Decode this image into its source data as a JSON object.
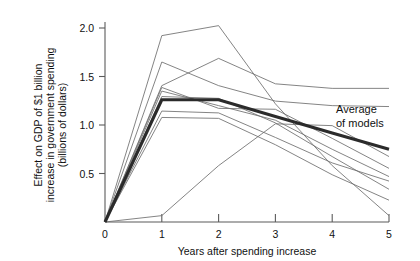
{
  "chart_data": {
    "type": "line",
    "title": "",
    "subtitle": "",
    "xlabel": "Years after spending increase",
    "ylabel": "Effect on GDP of $1 billion increase in government spending (billions of dollars)",
    "ylabel_line1": "Effect on GDP of $1 billion",
    "ylabel_line2": "increase in government spending",
    "ylabel_line3": "(billions of dollars)",
    "x": [
      0,
      1,
      2,
      3,
      4,
      5
    ],
    "xlim": [
      0,
      5
    ],
    "ylim": [
      0,
      2.2
    ],
    "xticks": [
      0,
      1,
      2,
      3,
      4,
      5
    ],
    "xtick_labels": [
      "0",
      "1",
      "2",
      "3",
      "4",
      "5"
    ],
    "yticks": [
      0,
      0.5,
      1.0,
      1.5,
      2.0
    ],
    "ytick_labels": [
      "0",
      "0.5",
      "1.0",
      "1.5",
      "2.0"
    ],
    "grid": false,
    "legend_position": "none",
    "annotations": [
      {
        "name": "average-of-models",
        "line1": "Average",
        "line2": "of models",
        "x": 4.05,
        "y": 1.13
      }
    ],
    "series": [
      {
        "name": "model-1",
        "emphasis": "normal",
        "values": [
          0,
          2.05,
          2.16,
          1.3,
          0.62,
          0.07
        ]
      },
      {
        "name": "model-2",
        "emphasis": "normal",
        "values": [
          0,
          1.76,
          1.5,
          1.33,
          1.28,
          1.27
        ]
      },
      {
        "name": "model-3",
        "emphasis": "normal",
        "values": [
          0,
          1.5,
          1.8,
          1.52,
          1.47,
          1.47
        ]
      },
      {
        "name": "model-4",
        "emphasis": "normal",
        "values": [
          0,
          1.48,
          1.25,
          1.24,
          0.92,
          0.59
        ]
      },
      {
        "name": "model-5",
        "emphasis": "normal",
        "values": [
          0,
          1.44,
          1.28,
          1.12,
          0.8,
          0.5
        ]
      },
      {
        "name": "model-6",
        "emphasis": "normal",
        "values": [
          0,
          1.38,
          1.36,
          1.09,
          0.72,
          0.36
        ]
      },
      {
        "name": "model-7",
        "emphasis": "normal",
        "values": [
          0,
          1.22,
          1.2,
          0.93,
          0.65,
          0.45
        ]
      },
      {
        "name": "model-8",
        "emphasis": "normal",
        "values": [
          0,
          1.15,
          1.14,
          0.85,
          0.52,
          0.24
        ]
      },
      {
        "name": "model-9",
        "emphasis": "normal",
        "values": [
          0,
          0.07,
          0.62,
          1.08,
          1.06,
          0.72
        ]
      },
      {
        "name": "average-of-models",
        "emphasis": "bold",
        "values": [
          0,
          1.345,
          1.345,
          1.16,
          0.98,
          0.8
        ]
      }
    ]
  },
  "axes": {
    "x_axis_name": "years-after-spending-increase",
    "y_axis_name": "effect-on-gdp"
  }
}
